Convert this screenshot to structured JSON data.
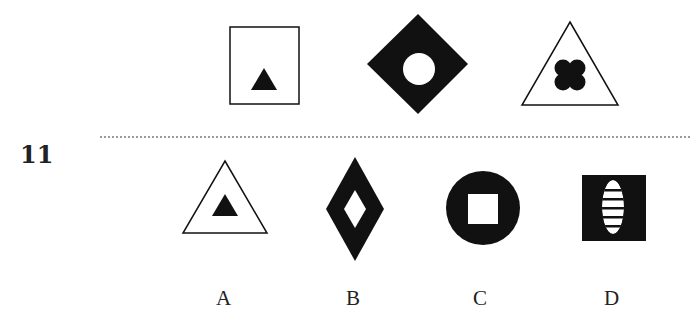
{
  "question": {
    "number": "11"
  },
  "colors": {
    "ink": "#111111",
    "background": "#ffffff",
    "divider": "#9a9a9a"
  },
  "sequence": [
    {
      "position": 1,
      "outer": "square",
      "outer_fill": "white-outline",
      "inner": "triangle",
      "inner_fill": "black"
    },
    {
      "position": 2,
      "outer": "diamond",
      "outer_fill": "black",
      "inner": "circle",
      "inner_fill": "white"
    },
    {
      "position": 3,
      "outer": "triangle",
      "outer_fill": "white-outline",
      "inner": "four-lobed-cross",
      "inner_fill": "black"
    }
  ],
  "options": [
    {
      "label": "A",
      "outer": "triangle",
      "outer_fill": "white-outline",
      "inner": "triangle",
      "inner_fill": "black"
    },
    {
      "label": "B",
      "outer": "tall-diamond",
      "outer_fill": "black",
      "inner": "tall-diamond",
      "inner_fill": "white"
    },
    {
      "label": "C",
      "outer": "circle",
      "outer_fill": "black",
      "inner": "square",
      "inner_fill": "white"
    },
    {
      "label": "D",
      "outer": "square",
      "outer_fill": "black",
      "inner": "striped-ellipse",
      "inner_fill": "white"
    }
  ]
}
